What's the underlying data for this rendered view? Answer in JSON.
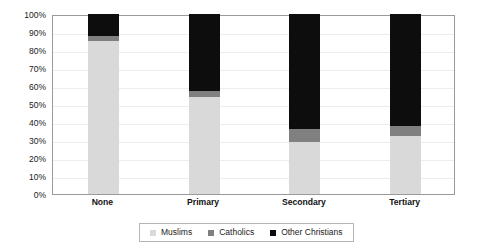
{
  "chart_data": {
    "type": "bar",
    "subtype": "stacked-100-percent",
    "title": "",
    "subtitle": "",
    "xlabel": "",
    "ylabel": "",
    "categories": [
      "None",
      "Primary",
      "Secondary",
      "Tertiary"
    ],
    "series": [
      {
        "name": "Muslims",
        "color": "#d9d9d9",
        "values": [
          85,
          54,
          29,
          32
        ]
      },
      {
        "name": "Catholics",
        "color": "#808080",
        "values": [
          3,
          3,
          7,
          6
        ]
      },
      {
        "name": "Other Christians",
        "color": "#0d0d0d",
        "values": [
          12,
          43,
          64,
          62
        ]
      }
    ],
    "ylim": [
      0,
      100
    ],
    "ytick_step": 10,
    "ytick_labels": [
      "0%",
      "10%",
      "20%",
      "30%",
      "40%",
      "50%",
      "60%",
      "70%",
      "80%",
      "90%",
      "100%"
    ],
    "grid": true,
    "legend_position": "bottom",
    "value_suffix": "%"
  },
  "legend": {
    "entries": [
      {
        "label": "Muslims",
        "color": "#d9d9d9"
      },
      {
        "label": "Catholics",
        "color": "#808080"
      },
      {
        "label": "Other Christians",
        "color": "#0d0d0d"
      }
    ]
  },
  "axes": {
    "y_labels": [
      "100%",
      "90%",
      "80%",
      "70%",
      "60%",
      "50%",
      "40%",
      "30%",
      "20%",
      "10%",
      "0%"
    ],
    "x_labels": [
      "None",
      "Primary",
      "Secondary",
      "Tertiary"
    ]
  },
  "style": {
    "plot_border_color": "#9a9a9a",
    "gridline_color": "#ededed",
    "background": "#ffffff",
    "text_color": "#1a1a1a"
  }
}
